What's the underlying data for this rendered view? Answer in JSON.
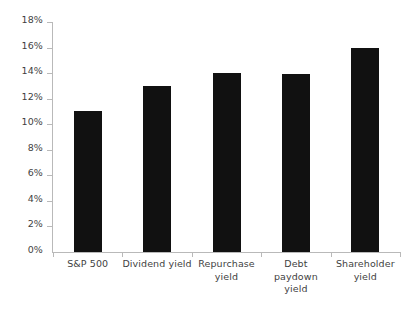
{
  "chart_data": {
    "type": "bar",
    "title": "",
    "subtitle": "",
    "xlabel": "",
    "ylabel": "",
    "ylim": [
      0,
      18
    ],
    "ytick_labels": [
      "0%",
      "2%",
      "4%",
      "6%",
      "8%",
      "10%",
      "12%",
      "14%",
      "16%",
      "18%"
    ],
    "ytick_values": [
      0,
      2,
      4,
      6,
      8,
      10,
      12,
      14,
      16,
      18
    ],
    "grid": false,
    "legend": false,
    "legend_position": "none",
    "bar_color": "#111111",
    "axis_color": "#b9b9b9",
    "categories": [
      "S&P 500",
      "Dividend yield",
      "Repurchase yield",
      "Debt paydown yield",
      "Shareholder yield"
    ],
    "category_lines": [
      [
        "S&P 500"
      ],
      [
        "Dividend yield"
      ],
      [
        "Repurchase",
        "yield"
      ],
      [
        "Debt paydown",
        "yield"
      ],
      [
        "Shareholder",
        "yield"
      ]
    ],
    "values": [
      11.0,
      13.0,
      14.0,
      13.9,
      16.0
    ]
  }
}
